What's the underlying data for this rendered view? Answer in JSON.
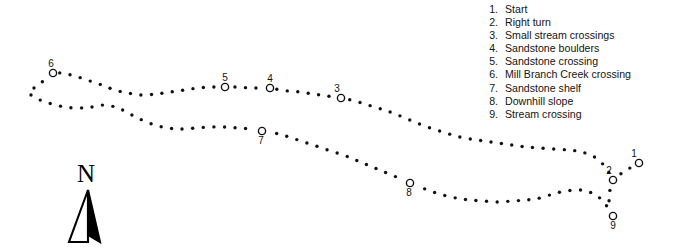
{
  "figure": {
    "type": "trail-map",
    "title": "",
    "background_color": "#ffffff",
    "ink_color": "#111111"
  },
  "legend": {
    "items": [
      {
        "number": "1.",
        "label": "Start"
      },
      {
        "number": "2.",
        "label": "Right turn"
      },
      {
        "number": "3.",
        "label": "Small stream crossings"
      },
      {
        "number": "4.",
        "label": "Sandstone boulders"
      },
      {
        "number": "5.",
        "label": "Sandstone crossing"
      },
      {
        "number": "6.",
        "label": "Mill Branch Creek crossing"
      },
      {
        "number": "7.",
        "label": "Sandstone shelf"
      },
      {
        "number": "8.",
        "label": "Downhill slope"
      },
      {
        "number": "9.",
        "label": "Stream crossing"
      }
    ]
  },
  "compass": {
    "letter": "N",
    "direction": "north",
    "needle_left_fill": "#ffffff",
    "needle_right_fill": "#000000"
  },
  "markers": [
    {
      "id": "1",
      "label": "1",
      "cx": 639,
      "cy": 163,
      "label_x": 634,
      "label_y": 149
    },
    {
      "id": "2",
      "label": "2",
      "cx": 613,
      "cy": 180,
      "label_x": 609,
      "label_y": 166
    },
    {
      "id": "3",
      "label": "3",
      "cx": 341,
      "cy": 98,
      "label_x": 337,
      "label_y": 84
    },
    {
      "id": "4",
      "label": "4",
      "cx": 270,
      "cy": 88,
      "label_x": 270,
      "label_y": 74
    },
    {
      "id": "5",
      "label": "5",
      "cx": 225,
      "cy": 87,
      "label_x": 225,
      "label_y": 73
    },
    {
      "id": "6",
      "label": "6",
      "cx": 53,
      "cy": 73,
      "label_x": 51,
      "label_y": 59
    },
    {
      "id": "7",
      "label": "7",
      "cx": 262,
      "cy": 131,
      "label_x": 261,
      "label_y": 136
    },
    {
      "id": "8",
      "label": "8",
      "cx": 410,
      "cy": 183,
      "label_x": 409,
      "label_y": 188
    },
    {
      "id": "9",
      "label": "9",
      "cx": 613,
      "cy": 216,
      "label_x": 613,
      "label_y": 221
    }
  ],
  "marker_style": {
    "radius": 3.6,
    "stroke_width": 1.4,
    "stroke": "#111111",
    "fill": "#ffffff"
  },
  "trail_style": {
    "dot_radius": 1.7,
    "dot_color": "#111111",
    "dot_spacing": 10.4
  },
  "trail_paths": [
    {
      "name": "north-branch",
      "points": [
        [
          34,
          88
        ],
        [
          42,
          82
        ],
        [
          52,
          73
        ],
        [
          66,
          74
        ],
        [
          78,
          77
        ],
        [
          90,
          81
        ],
        [
          102,
          85
        ],
        [
          115,
          90
        ],
        [
          128,
          93
        ],
        [
          142,
          95
        ],
        [
          156,
          94
        ],
        [
          170,
          92
        ],
        [
          184,
          90
        ],
        [
          198,
          88
        ],
        [
          212,
          87
        ],
        [
          225,
          87
        ],
        [
          238,
          87
        ],
        [
          250,
          88
        ],
        [
          262,
          88
        ],
        [
          275,
          89
        ],
        [
          288,
          91
        ],
        [
          300,
          92
        ],
        [
          313,
          94
        ],
        [
          327,
          96
        ],
        [
          341,
          98
        ],
        [
          355,
          101
        ],
        [
          368,
          105
        ],
        [
          381,
          109
        ],
        [
          393,
          113
        ],
        [
          405,
          118
        ],
        [
          417,
          123
        ],
        [
          430,
          128
        ],
        [
          443,
          132
        ],
        [
          456,
          136
        ],
        [
          470,
          139
        ],
        [
          484,
          141
        ],
        [
          498,
          143
        ],
        [
          512,
          145
        ],
        [
          526,
          147
        ],
        [
          540,
          148
        ],
        [
          554,
          149
        ],
        [
          568,
          150
        ],
        [
          582,
          152
        ],
        [
          596,
          158
        ],
        [
          606,
          168
        ],
        [
          613,
          180
        ]
      ]
    },
    {
      "name": "south-branch",
      "points": [
        [
          31,
          95
        ],
        [
          40,
          100
        ],
        [
          52,
          104
        ],
        [
          65,
          107
        ],
        [
          78,
          108
        ],
        [
          92,
          107
        ],
        [
          105,
          105
        ],
        [
          118,
          108
        ],
        [
          130,
          114
        ],
        [
          142,
          120
        ],
        [
          155,
          125
        ],
        [
          168,
          128
        ],
        [
          182,
          129
        ],
        [
          196,
          128
        ],
        [
          210,
          127
        ],
        [
          224,
          127
        ],
        [
          238,
          128
        ],
        [
          250,
          129
        ],
        [
          262,
          131
        ],
        [
          274,
          133
        ],
        [
          286,
          136
        ],
        [
          298,
          140
        ],
        [
          310,
          144
        ],
        [
          322,
          148
        ],
        [
          334,
          152
        ],
        [
          346,
          156
        ],
        [
          358,
          161
        ],
        [
          370,
          166
        ],
        [
          382,
          171
        ],
        [
          394,
          176
        ],
        [
          406,
          181
        ],
        [
          418,
          186
        ],
        [
          430,
          191
        ],
        [
          443,
          195
        ],
        [
          456,
          198
        ],
        [
          470,
          200
        ],
        [
          484,
          201
        ],
        [
          498,
          202
        ],
        [
          512,
          201
        ],
        [
          526,
          200
        ],
        [
          540,
          198
        ],
        [
          553,
          194
        ],
        [
          566,
          191
        ],
        [
          580,
          190
        ],
        [
          592,
          193
        ],
        [
          602,
          200
        ],
        [
          608,
          208
        ],
        [
          613,
          216
        ]
      ]
    },
    {
      "name": "start-spur",
      "points": [
        [
          639,
          163
        ],
        [
          630,
          168
        ],
        [
          622,
          173
        ],
        [
          613,
          180
        ],
        [
          610,
          190
        ],
        [
          609,
          200
        ],
        [
          611,
          209
        ],
        [
          613,
          216
        ]
      ]
    }
  ]
}
